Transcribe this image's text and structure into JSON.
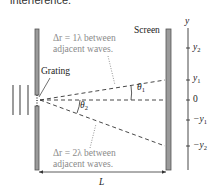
{
  "header": {
    "text": "interference."
  },
  "diagram": {
    "grating_label": "Grating",
    "screen_label": "Screen",
    "annotation_top": {
      "line1": "Δr = 1λ between",
      "line2": "adjacent waves."
    },
    "annotation_bottom": {
      "line1": "Δr = 2λ between",
      "line2": "adjacent waves."
    },
    "angles": {
      "theta1": "θ",
      "theta1_sub": "1",
      "theta2": "θ",
      "theta2_sub": "2"
    },
    "distance_label": "L",
    "axis": {
      "label": "y",
      "ticks": [
        {
          "label": "y",
          "sub": "2"
        },
        {
          "label": "y",
          "sub": "1"
        },
        {
          "label": "0",
          "sub": ""
        },
        {
          "label": "−y",
          "sub": "1"
        },
        {
          "label": "−y",
          "sub": "2"
        }
      ]
    },
    "colors": {
      "barrier_fill": "#9a9a9a",
      "barrier_stroke": "#555555",
      "line": "#333333",
      "annotation": "#8a8a8a"
    }
  }
}
